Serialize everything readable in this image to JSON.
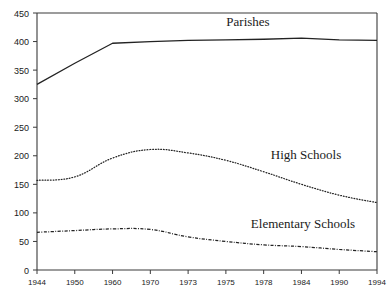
{
  "chart_data": {
    "type": "line",
    "title": "",
    "xlabel": "",
    "ylabel": "",
    "categories": [
      "1944",
      "1950",
      "1960",
      "1970",
      "1973",
      "1975",
      "1978",
      "1984",
      "1990",
      "1994"
    ],
    "ylim": [
      0,
      450
    ],
    "xlim": [
      0,
      9
    ],
    "yticks": [
      0,
      50,
      100,
      150,
      200,
      250,
      300,
      350,
      400,
      450
    ],
    "grid": false,
    "legend_position": "inline-annotations",
    "series": [
      {
        "name": "Parishes",
        "style": "solid",
        "color": "#232323",
        "values": [
          325,
          362,
          397,
          400,
          402,
          403,
          404,
          406,
          403,
          402
        ]
      },
      {
        "name": "High Schools",
        "style": "dotted",
        "color": "#232323",
        "values": [
          157,
          163,
          196,
          211,
          205,
          192,
          172,
          150,
          131,
          118
        ]
      },
      {
        "name": "Elementary Schools",
        "style": "dashdot",
        "color": "#232323",
        "values": [
          66,
          69,
          72,
          71,
          58,
          50,
          44,
          41,
          36,
          32
        ]
      }
    ],
    "annotations": [
      {
        "text": "Parishes",
        "x_px": 248,
        "y_px": 26
      },
      {
        "text": "High Schools",
        "x_px": 306,
        "y_px": 159
      },
      {
        "text": "Elementary Schools",
        "x_px": 303,
        "y_px": 228
      }
    ]
  },
  "axis": {
    "y_tick_labels": [
      "450",
      "400",
      "350",
      "300",
      "250",
      "200",
      "150",
      "100",
      "50",
      "0"
    ],
    "x_tick_labels": [
      "1944",
      "1950",
      "1960",
      "1970",
      "1973",
      "1975",
      "1978",
      "1984",
      "1990",
      "1994"
    ]
  },
  "colors": {
    "background": "#ffffff",
    "axis": "#3a3a3a",
    "line": "#232323",
    "text": "#1a1a1a"
  }
}
